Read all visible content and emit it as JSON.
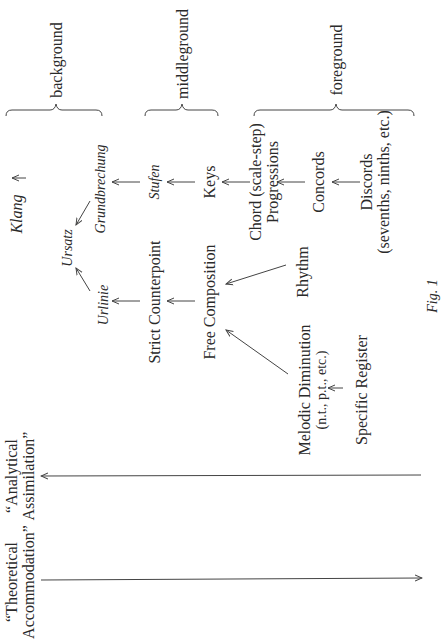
{
  "figure": {
    "caption": "Fig. 1",
    "levels": {
      "background": "background",
      "middleground": "middleground",
      "foreground": "foreground"
    },
    "nodes": {
      "klang": "Klang",
      "ursatz": "Ursatz",
      "urlinie": "Urlinie",
      "grundbrechung": "Grundbrechung",
      "stufen": "Stufen",
      "keys": "Keys",
      "strict_counterpoint": "Strict Counterpoint",
      "free_composition": "Free Composition",
      "chord_progressions_line1": "Chord (scale-step)",
      "chord_progressions_line2": "Progressions",
      "concords": "Concords",
      "discords_line1": "Discords",
      "discords_line2": "(sevenths, ninths, etc.)",
      "rhythm": "Rhythm",
      "melodic_diminution_line1": "Melodic Diminution",
      "melodic_diminution_line2": "(n.t., p.t., etc.)",
      "specific_register": "Specific Register"
    },
    "axes": {
      "analytical_line1": "“Analytical",
      "analytical_line2": "Assimilation”",
      "theoretical_line1": "“Theoretical",
      "theoretical_line2": "Accommodation”"
    }
  }
}
